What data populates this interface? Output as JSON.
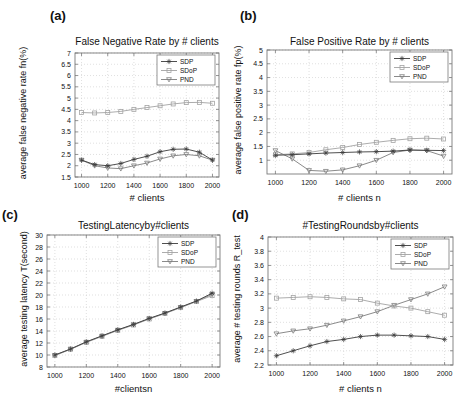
{
  "figure": {
    "background": "#ffffff",
    "text_color": "#111111",
    "axis_color": "#7a7a7a",
    "grid_color": "#cbcbcb"
  },
  "chart_data": [
    {
      "type": "line",
      "panel_label": "(a)",
      "title": "False Negative Rate by # clients",
      "xlabel": "# clients",
      "ylabel": "average false negative rate fn(%)",
      "x": [
        1000,
        1100,
        1200,
        1300,
        1400,
        1500,
        1600,
        1700,
        1800,
        1900,
        2000
      ],
      "xlim": [
        950,
        2050
      ],
      "ylim": [
        1.5,
        7
      ],
      "xticks": [
        1000,
        1200,
        1400,
        1600,
        1800,
        2000
      ],
      "xtick_labels": [
        "1000",
        "1200",
        "1400",
        "1600",
        "1800",
        "2000"
      ],
      "yticks": [
        1.5,
        2,
        2.5,
        3,
        3.5,
        4,
        4.5,
        5,
        5.5,
        6,
        6.5,
        7
      ],
      "ytick_labels": [
        "1.5",
        "2",
        "2.5",
        "3",
        "3.5",
        "4",
        "4.5",
        "5",
        "5.5",
        "6",
        "6.5",
        "7"
      ],
      "grid": true,
      "legend_position": "upper-right",
      "series": [
        {
          "name": "SDP",
          "marker": "asterisk",
          "color": "#3b3b3b",
          "values": [
            2.25,
            2.05,
            2.0,
            2.1,
            2.28,
            2.42,
            2.62,
            2.73,
            2.74,
            2.6,
            2.25
          ]
        },
        {
          "name": "SDoP",
          "marker": "square",
          "color": "#a3a3a3",
          "values": [
            4.36,
            4.34,
            4.36,
            4.41,
            4.5,
            4.58,
            4.66,
            4.74,
            4.8,
            4.81,
            4.77
          ]
        },
        {
          "name": "PND",
          "marker": "triangle-down",
          "color": "#7d7d7d",
          "values": [
            2.25,
            2.0,
            1.9,
            1.87,
            2.0,
            2.12,
            2.3,
            2.44,
            2.5,
            2.44,
            2.25
          ]
        }
      ]
    },
    {
      "type": "line",
      "panel_label": "(b)",
      "title": "False Positive Rate by # clients",
      "xlabel": "# clients n",
      "ylabel": "average false positive rate fp(%)",
      "x": [
        1000,
        1100,
        1200,
        1300,
        1400,
        1500,
        1600,
        1700,
        1800,
        1900,
        2000
      ],
      "xlim": [
        950,
        2050
      ],
      "ylim": [
        0.5,
        5
      ],
      "xticks": [
        1000,
        1200,
        1400,
        1600,
        1800,
        2000
      ],
      "xtick_labels": [
        "1000",
        "1200",
        "1400",
        "1600",
        "1800",
        "2000"
      ],
      "yticks": [
        1,
        1.5,
        2,
        2.5,
        3,
        3.5,
        4,
        4.5,
        5
      ],
      "ytick_labels": [
        "1",
        "1.5",
        "2",
        "2.5",
        "3",
        "3.5",
        "4",
        "4.5",
        "5"
      ],
      "grid": true,
      "legend_position": "upper-right",
      "series": [
        {
          "name": "SDP",
          "marker": "asterisk",
          "color": "#3b3b3b",
          "values": [
            1.18,
            1.2,
            1.23,
            1.26,
            1.28,
            1.3,
            1.31,
            1.33,
            1.37,
            1.36,
            1.35
          ]
        },
        {
          "name": "SDoP",
          "marker": "square",
          "color": "#a3a3a3",
          "values": [
            1.2,
            1.23,
            1.28,
            1.38,
            1.46,
            1.57,
            1.65,
            1.72,
            1.78,
            1.8,
            1.77
          ]
        },
        {
          "name": "PND",
          "marker": "triangle-down",
          "color": "#7d7d7d",
          "values": [
            1.35,
            1.05,
            0.63,
            0.6,
            0.65,
            0.8,
            1.0,
            1.28,
            1.37,
            1.35,
            1.15
          ]
        }
      ]
    },
    {
      "type": "line",
      "panel_label": "(c)",
      "title": "TestingLatencyby#clients",
      "xlabel": "#clientsn",
      "ylabel": "average testing latency T(second)",
      "x": [
        1000,
        1100,
        1200,
        1300,
        1400,
        1500,
        1600,
        1700,
        1800,
        1900,
        2000
      ],
      "xlim": [
        950,
        2050
      ],
      "ylim": [
        8,
        30
      ],
      "xticks": [
        1000,
        1200,
        1400,
        1600,
        1800,
        2000
      ],
      "xtick_labels": [
        "1000",
        "1200",
        "1400",
        "1600",
        "1800",
        "2000"
      ],
      "yticks": [
        8,
        10,
        12,
        14,
        16,
        18,
        20,
        22,
        24,
        26,
        28,
        30
      ],
      "ytick_labels": [
        "8",
        "10",
        "12",
        "14",
        "16",
        "18",
        "20",
        "22",
        "24",
        "26",
        "28",
        "30"
      ],
      "grid": true,
      "legend_position": "upper-right",
      "series": [
        {
          "name": "SDP",
          "marker": "asterisk",
          "color": "#3b3b3b",
          "values": [
            10,
            11,
            12.2,
            13.2,
            14.2,
            15.1,
            16.1,
            17,
            18,
            19,
            20.3
          ]
        },
        {
          "name": "SDoP",
          "marker": "square",
          "color": "#a3a3a3",
          "values": [
            9.9,
            10.95,
            12.1,
            13.1,
            14.1,
            15,
            16,
            16.9,
            17.9,
            18.9,
            19.9
          ]
        },
        {
          "name": "PND",
          "marker": "triangle-down",
          "color": "#7d7d7d",
          "values": [
            9.95,
            11,
            12.15,
            13.15,
            14.15,
            15.05,
            16.05,
            16.95,
            17.95,
            18.95,
            20.1
          ]
        }
      ]
    },
    {
      "type": "line",
      "panel_label": "(d)",
      "title": "#TestingRoundsby#clients",
      "xlabel": "# clients n",
      "ylabel": "average # testing rounds R_test",
      "x": [
        1000,
        1100,
        1200,
        1300,
        1400,
        1500,
        1600,
        1700,
        1800,
        1900,
        2000
      ],
      "xlim": [
        950,
        2050
      ],
      "ylim": [
        2.2,
        4
      ],
      "xticks": [
        1000,
        1200,
        1400,
        1600,
        1800,
        2000
      ],
      "xtick_labels": [
        "1000",
        "1200",
        "1400",
        "1600",
        "1800",
        "2000"
      ],
      "yticks": [
        2.2,
        2.4,
        2.6,
        2.8,
        3,
        3.2,
        3.4,
        3.6,
        3.8,
        4
      ],
      "ytick_labels": [
        "2.2",
        "2.4",
        "2.6",
        "2.8",
        "3",
        "3.2",
        "3.4",
        "3.6",
        "3.8",
        "4"
      ],
      "grid": true,
      "legend_position": "upper-right",
      "series": [
        {
          "name": "SDP",
          "marker": "asterisk",
          "color": "#3b3b3b",
          "values": [
            2.33,
            2.4,
            2.47,
            2.53,
            2.56,
            2.6,
            2.62,
            2.62,
            2.61,
            2.6,
            2.56
          ]
        },
        {
          "name": "SDoP",
          "marker": "square",
          "color": "#a3a3a3",
          "values": [
            3.14,
            3.15,
            3.16,
            3.15,
            3.13,
            3.12,
            3.07,
            3.03,
            3.0,
            2.95,
            2.9
          ]
        },
        {
          "name": "PND",
          "marker": "triangle-down",
          "color": "#7d7d7d",
          "values": [
            2.64,
            2.68,
            2.71,
            2.76,
            2.82,
            2.88,
            2.95,
            3.04,
            3.12,
            3.2,
            3.3
          ]
        }
      ]
    }
  ]
}
